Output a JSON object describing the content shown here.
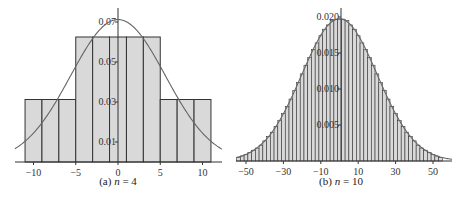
{
  "chart_data": [
    {
      "type": "bar",
      "title": "(a) n = 4",
      "caption_prefix": "(a) ",
      "caption_var": "n",
      "caption_suffix": " = 4",
      "xlabel": "",
      "ylabel": "",
      "xlim": [
        -12,
        12
      ],
      "ylim": [
        0,
        0.072
      ],
      "bin_width": 2,
      "categories": [
        -10,
        -8,
        -6,
        -4,
        -2,
        0,
        2,
        4,
        6,
        8,
        10
      ],
      "values": [
        0.03125,
        0.03125,
        0.03125,
        0.0625,
        0.0625,
        0.0625,
        0.0625,
        0.0625,
        0.03125,
        0.03125,
        0.03125
      ],
      "x_ticks": [
        -10,
        -5,
        0,
        5,
        10
      ],
      "x_tick_labels": [
        "−10",
        "−5",
        "0",
        "5",
        "10"
      ],
      "y_ticks": [
        0.01,
        0.03,
        0.05,
        0.07
      ],
      "y_tick_labels": [
        "0.01",
        "0.03",
        "0.05",
        "0.07"
      ],
      "overlay": {
        "type": "normal_curve",
        "mean": 0,
        "sd": 5.6
      },
      "bar_color": "#d9d9d9",
      "grid": false
    },
    {
      "type": "bar",
      "title": "(b) n = 10",
      "caption_prefix": "(b) ",
      "caption_var": "n",
      "caption_suffix": " = 10",
      "xlabel": "",
      "ylabel": "",
      "xlim": [
        -56,
        56
      ],
      "ylim": [
        0,
        0.0205
      ],
      "bin_width": 2,
      "categories": [
        -54,
        -52,
        -50,
        -48,
        -46,
        -44,
        -42,
        -40,
        -38,
        -36,
        -34,
        -32,
        -30,
        -28,
        -26,
        -24,
        -22,
        -20,
        -18,
        -16,
        -14,
        -12,
        -10,
        -8,
        -6,
        -4,
        -2,
        0,
        2,
        4,
        6,
        8,
        10,
        12,
        14,
        16,
        18,
        20,
        22,
        24,
        26,
        28,
        30,
        32,
        34,
        36,
        38,
        40,
        42,
        44,
        46,
        48,
        50,
        52,
        54
      ],
      "values": [
        0.0005,
        0.0007,
        0.0009,
        0.0012,
        0.0015,
        0.0018,
        0.0022,
        0.0028,
        0.0034,
        0.004,
        0.0048,
        0.0056,
        0.0066,
        0.0076,
        0.0086,
        0.0098,
        0.0109,
        0.0121,
        0.0133,
        0.0144,
        0.0155,
        0.0164,
        0.0174,
        0.0183,
        0.0189,
        0.0195,
        0.0197,
        0.0197,
        0.0197,
        0.0195,
        0.0189,
        0.0183,
        0.0174,
        0.0164,
        0.0155,
        0.0144,
        0.0133,
        0.0121,
        0.0109,
        0.0098,
        0.0086,
        0.0076,
        0.0066,
        0.0056,
        0.0048,
        0.004,
        0.0034,
        0.0028,
        0.0022,
        0.0018,
        0.0015,
        0.0012,
        0.0009,
        0.0007,
        0.0005
      ],
      "x_ticks": [
        -50,
        -30,
        -10,
        10,
        30,
        50
      ],
      "x_tick_labels": [
        "−50",
        "−30",
        "−10",
        "10",
        "30",
        "50"
      ],
      "y_ticks": [
        0.005,
        0.01,
        0.015,
        0.02
      ],
      "y_tick_labels": [
        "0.005",
        "0.010",
        "0.015",
        "0.020"
      ],
      "overlay": {
        "type": "normal_curve",
        "mean": 0,
        "sd": 20.2
      },
      "bar_color": "#d9d9d9",
      "grid": false
    }
  ]
}
